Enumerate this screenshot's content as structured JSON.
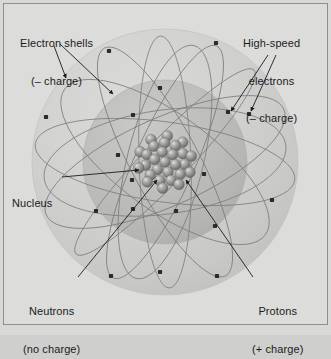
{
  "figure": {
    "background_color": "#dcdcda",
    "border_color": "#8e8e8c"
  },
  "labels": {
    "electron_shells": {
      "line1": "Electron shells",
      "line2": "(– charge)",
      "arrow_count": 2
    },
    "high_speed_electrons": {
      "line1": "High-speed",
      "line2": "electrons",
      "line3": "(– charge)",
      "arrow_count": 2
    },
    "nucleus": {
      "line1": "Nucleus",
      "arrow_count": 1
    },
    "neutrons": {
      "line1": "Neutrons",
      "line2": "(no charge)",
      "arrow_count": 1
    },
    "protons": {
      "line1": "Protons",
      "line2": "(+ charge)",
      "arrow_count": 1
    }
  },
  "diagram": {
    "center": {
      "x": 165,
      "y": 162
    },
    "outer_shell": {
      "name": "outer-electron-shell",
      "radius": 133,
      "fill": "#cdcdcb",
      "edge": "#c2c2c0"
    },
    "inner_shell": {
      "name": "inner-electron-shell",
      "radius": 82,
      "fill": "#bcbcba",
      "edge": "#b2b2b0"
    },
    "nucleus": {
      "name": "nucleus-cluster",
      "radius": 30,
      "particle_count": 28,
      "particle_radius": 5.4,
      "fill": "#8d8d8b",
      "highlight": "#e8e8e6",
      "shadow": "#5e5e5c"
    },
    "orbits": {
      "stroke": "#7d7d7b",
      "stroke_width": 0.8,
      "count": 9,
      "paths": [
        {
          "rx": 131,
          "ry": 40,
          "rot": 8
        },
        {
          "rx": 129,
          "ry": 34,
          "rot": 62
        },
        {
          "rx": 127,
          "ry": 30,
          "rot": 114
        },
        {
          "rx": 130,
          "ry": 44,
          "rot": 156
        },
        {
          "rx": 126,
          "ry": 26,
          "rot": 88
        },
        {
          "rx": 124,
          "ry": 48,
          "rot": 36
        },
        {
          "rx": 128,
          "ry": 22,
          "rot": 134
        },
        {
          "rx": 122,
          "ry": 52,
          "rot": 172
        },
        {
          "rx": 120,
          "ry": 38,
          "rot": 104
        }
      ]
    },
    "electrons": {
      "name": "electron-particle",
      "color": "#2b2b2b",
      "size": 4.2,
      "count": 18,
      "positions": [
        {
          "x": 109,
          "y": 51
        },
        {
          "x": 216,
          "y": 43
        },
        {
          "x": 160,
          "y": 88
        },
        {
          "x": 133,
          "y": 115
        },
        {
          "x": 46,
          "y": 117
        },
        {
          "x": 228,
          "y": 112
        },
        {
          "x": 249,
          "y": 114
        },
        {
          "x": 118,
          "y": 155
        },
        {
          "x": 132,
          "y": 180
        },
        {
          "x": 204,
          "y": 174
        },
        {
          "x": 133,
          "y": 209
        },
        {
          "x": 176,
          "y": 211
        },
        {
          "x": 96,
          "y": 211
        },
        {
          "x": 215,
          "y": 226
        },
        {
          "x": 272,
          "y": 200
        },
        {
          "x": 111,
          "y": 276
        },
        {
          "x": 160,
          "y": 272
        },
        {
          "x": 217,
          "y": 276
        }
      ]
    },
    "leader_lines": {
      "stroke": "#1b1b1b",
      "stroke_width": 0.9,
      "arrowhead_size": 4
    }
  }
}
